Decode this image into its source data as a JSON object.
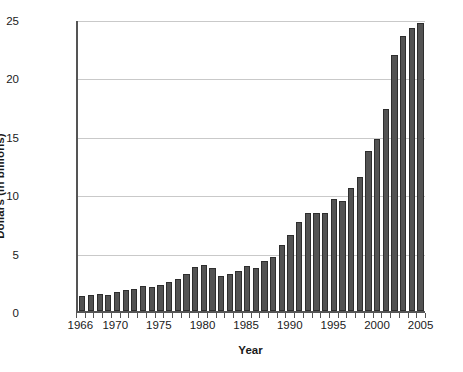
{
  "chart_data": {
    "type": "bar",
    "title": "",
    "xlabel": "Year",
    "ylabel": "Dollars (in billions)",
    "xlim": [
      1965.5,
      2005.5
    ],
    "ylim": [
      0,
      25
    ],
    "yticks": [
      0,
      5,
      10,
      15,
      20,
      25
    ],
    "ytick_labels": [
      "0",
      "5",
      "10",
      "15",
      "20",
      "25"
    ],
    "xticks": [
      1966,
      1970,
      1975,
      1980,
      1985,
      1990,
      1995,
      2000,
      2005
    ],
    "xtick_labels": [
      "1966",
      "1970",
      "1975",
      "1980",
      "1985",
      "1990",
      "1995",
      "2000",
      "2005"
    ],
    "grid": "horizontal",
    "legend": "none",
    "bar_color": "#535353",
    "bar_edge_color": "#2e2e2e",
    "grid_color": "#c9c9c9",
    "axis_color": "#555555",
    "categories": [
      "1966",
      "1967",
      "1968",
      "1969",
      "1970",
      "1971",
      "1972",
      "1973",
      "1974",
      "1975",
      "1976",
      "1977",
      "1978",
      "1979",
      "1980",
      "1981",
      "1982",
      "1983",
      "1984",
      "1985",
      "1986",
      "1987",
      "1988",
      "1989",
      "1990",
      "1991",
      "1992",
      "1993",
      "1994",
      "1995",
      "1996",
      "1997",
      "1998",
      "1999",
      "2000",
      "2001",
      "2002",
      "2003",
      "2004",
      "2005"
    ],
    "values": [
      1.25,
      1.35,
      1.45,
      1.35,
      1.6,
      1.8,
      1.9,
      2.15,
      2.05,
      2.25,
      2.5,
      2.75,
      3.15,
      3.8,
      3.9,
      3.7,
      3.0,
      3.15,
      3.4,
      3.85,
      3.65,
      4.3,
      4.65,
      5.65,
      6.55,
      7.6,
      8.35,
      8.35,
      8.35,
      9.6,
      9.45,
      10.55,
      11.45,
      13.7,
      14.7,
      17.3,
      21.9,
      23.55,
      24.2,
      24.65
    ]
  }
}
